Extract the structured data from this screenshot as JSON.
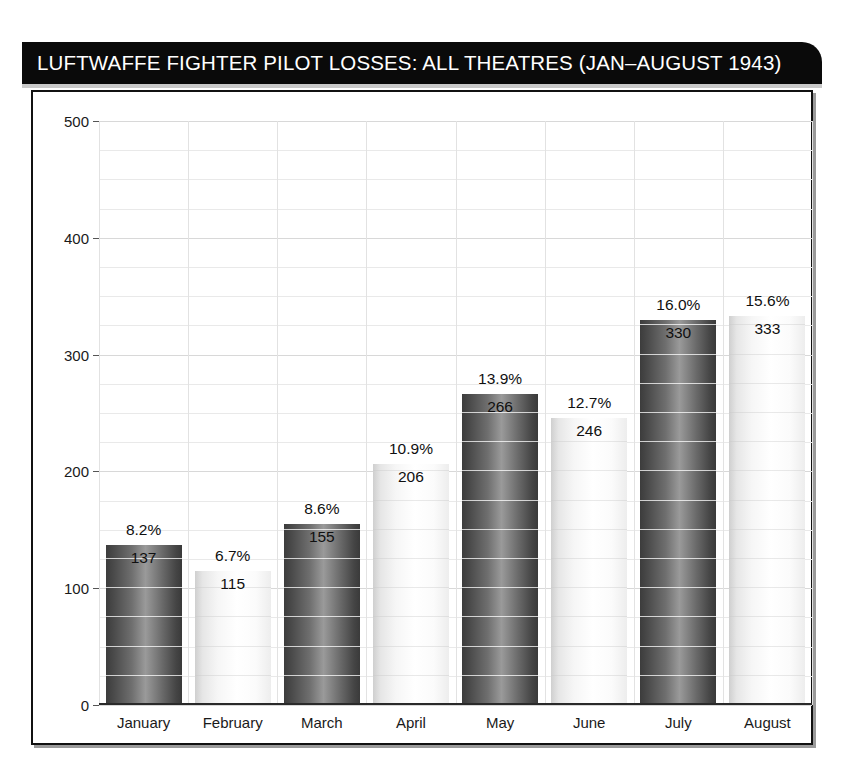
{
  "title": "LUFTWAFFE FIGHTER PILOT LOSSES: ALL THEATRES (JAN–AUGUST 1943)",
  "colors": {
    "title_bar": "#0a0a0a",
    "title_text": "#ffffff",
    "frame": "#111111",
    "bar_dark": "#5a5a5a",
    "bar_light": "#f2f2f2",
    "grid": "#e9e9e9",
    "axis_text": "#1a1a1a"
  },
  "chart_data": {
    "type": "bar",
    "title": "LUFTWAFFE FIGHTER PILOT LOSSES: ALL THEATRES (JAN–AUGUST 1943)",
    "xlabel": "",
    "ylabel": "",
    "ylim": [
      0,
      500
    ],
    "yticks": [
      0,
      100,
      200,
      300,
      400,
      500
    ],
    "ytick_labels": [
      "0",
      "100",
      "200",
      "300",
      "400",
      "500"
    ],
    "grid": true,
    "grid_interval": 25,
    "legend": false,
    "categories": [
      "January",
      "February",
      "March",
      "April",
      "May",
      "June",
      "July",
      "August"
    ],
    "values": [
      137,
      115,
      155,
      206,
      266,
      246,
      330,
      333
    ],
    "value_labels": [
      "137",
      "115",
      "155",
      "206",
      "266",
      "246",
      "330",
      "333"
    ],
    "percent_labels": [
      "8.2%",
      "6.7%",
      "8.6%",
      "10.9%",
      "13.9%",
      "12.7%",
      "16.0%",
      "15.6%"
    ],
    "percents": [
      8.2,
      6.7,
      8.6,
      10.9,
      13.9,
      12.7,
      16.0,
      15.6
    ],
    "bar_styles": [
      "dark",
      "light",
      "dark",
      "light",
      "dark",
      "light",
      "dark",
      "light"
    ]
  }
}
